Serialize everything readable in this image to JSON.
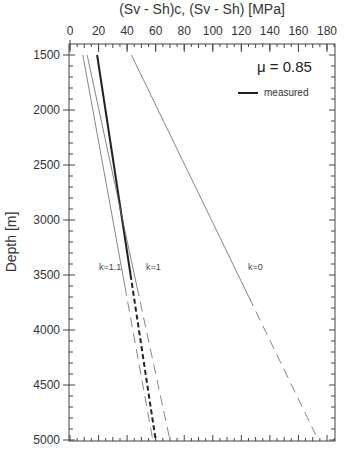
{
  "chart_data": {
    "type": "line",
    "title": "(Sv - Sh)c, (Sv - Sh)  [MPa]",
    "xlabel": "(Sv - Sh)c, (Sv - Sh)  [MPa]",
    "ylabel": "Depth [m]",
    "x_axis_position": "top",
    "y_axis_inverted": true,
    "xlim": [
      0,
      185
    ],
    "ylim": [
      1400,
      5000
    ],
    "x_ticks": [
      0,
      20,
      40,
      60,
      80,
      100,
      120,
      140,
      160,
      180
    ],
    "y_ticks": [
      1500,
      2000,
      2500,
      3000,
      3500,
      4000,
      4500,
      5000
    ],
    "grid": false,
    "annotation": "μ = 0.85",
    "legend": [
      {
        "label": "measured",
        "style": "thick solid"
      }
    ],
    "legend_position": "upper right",
    "series": [
      {
        "name": "measured",
        "style": "thick",
        "points": [
          [
            19,
            1500
          ],
          [
            60,
            5000
          ]
        ],
        "solid_until_depth": 3500,
        "dashed_below": true
      },
      {
        "name": "k=1.1",
        "label": "k=1.1",
        "style": "thin",
        "points": [
          [
            9,
            1500
          ],
          [
            58,
            5000
          ]
        ],
        "solid_until_depth": 3600,
        "dashed_below": true
      },
      {
        "name": "k=1",
        "label": "k=1",
        "style": "thin",
        "points": [
          [
            12,
            1500
          ],
          [
            70,
            5000
          ]
        ],
        "solid_until_depth": 3600,
        "dashed_below": true
      },
      {
        "name": "k=0",
        "label": "k=0",
        "style": "thin",
        "points": [
          [
            43,
            1500
          ],
          [
            172,
            4950
          ]
        ],
        "solid_until_depth": 3700,
        "dashed_below": true
      }
    ],
    "curve_labels": [
      {
        "text": "k=1.1",
        "x": 22,
        "depth": 3410
      },
      {
        "text": "k=1",
        "x": 56,
        "depth": 3410
      },
      {
        "text": "k=0",
        "x": 126,
        "depth": 3410
      }
    ]
  },
  "labels": {
    "title": "(Sv - Sh)c, (Sv - Sh)  [MPa]",
    "ylabel": "Depth [m]",
    "mu": "μ = 0.85",
    "legend_measured": "measured",
    "k11": "k=1.1",
    "k1": "k=1",
    "k0": "k=0"
  }
}
